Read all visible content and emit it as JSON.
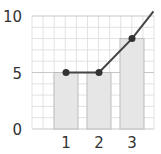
{
  "chart_data": {
    "type": "bar+line",
    "title": "",
    "xlabel": "",
    "ylabel": "",
    "categories": [
      "1",
      "2",
      "3"
    ],
    "series": [
      {
        "name": "bars",
        "type": "bar",
        "values": [
          5,
          5,
          8
        ]
      },
      {
        "name": "line",
        "type": "line",
        "values": [
          5,
          5,
          8
        ],
        "extends_to": {
          "x": 3.65,
          "y": 10.4
        }
      }
    ],
    "yticks": [
      "0",
      "5",
      "10"
    ],
    "ylim": [
      0,
      10
    ],
    "grid": true,
    "legend": null,
    "colors": {
      "bar_fill": "#e6e6e6",
      "bar_stroke": "#bdbdbd",
      "grid_minor": "#e2e2e2",
      "grid_major": "#c8c8c8",
      "line": "#444444",
      "marker": "#333333",
      "text": "#333333"
    }
  }
}
